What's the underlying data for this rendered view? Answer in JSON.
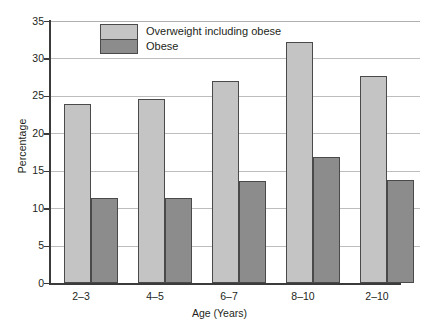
{
  "chart_data": {
    "type": "bar",
    "title": "",
    "xlabel": "Age (Years)",
    "ylabel": "Percentage",
    "categories": [
      "2–3",
      "4–5",
      "6–7",
      "8–10",
      "2–10"
    ],
    "series": [
      {
        "name": "Overweight including obese",
        "color": "#c4c4c4",
        "values": [
          23.9,
          24.6,
          27.0,
          32.2,
          27.7
        ]
      },
      {
        "name": "Obese",
        "color": "#8c8c8c",
        "values": [
          11.3,
          11.3,
          13.6,
          16.8,
          13.8
        ]
      }
    ],
    "ylim": [
      0,
      35
    ],
    "ytick_step": 5,
    "yticks": [
      "0",
      "5",
      "10",
      "15",
      "20",
      "25",
      "30",
      "35"
    ],
    "grid": "horizontal",
    "legend_position": "top-center",
    "axis_color": "#3b3b3b",
    "grid_color": "#bdbdbd",
    "background": "#ffffff"
  }
}
